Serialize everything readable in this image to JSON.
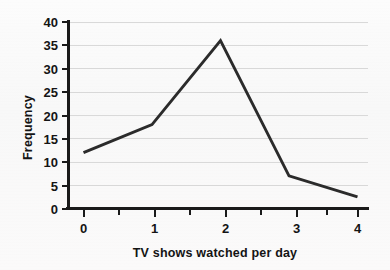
{
  "chart_data": {
    "type": "line",
    "title": "",
    "xlabel": "TV shows watched per day",
    "ylabel": "Frequency",
    "x": [
      0,
      1,
      2,
      3,
      4
    ],
    "values": [
      12,
      18,
      36,
      7,
      2.5
    ],
    "series": [
      {
        "name": "Frequency",
        "values": [
          12,
          18,
          36,
          7,
          2.5
        ]
      }
    ],
    "categories": [
      "0",
      "1",
      "2",
      "3",
      "4"
    ],
    "xlim": [
      0,
      4
    ],
    "ylim": [
      0,
      40
    ],
    "x_tick_labels": [
      "0",
      "1",
      "2",
      "3",
      "4"
    ],
    "x_tick_values": [
      0,
      1,
      2,
      3,
      4
    ],
    "x_minor_tick_values": [
      0.5,
      1.5,
      2.5,
      3.5
    ],
    "y_tick_labels": [
      "0",
      "5",
      "10",
      "15",
      "20",
      "25",
      "30",
      "35",
      "40"
    ],
    "y_tick_values": [
      0,
      5,
      10,
      15,
      20,
      25,
      30,
      35,
      40
    ],
    "grid": "horizontal",
    "legend": "none",
    "line_color": "#2b2b2b",
    "grid_color": "#d9d9d9",
    "axis_color": "#1a1a1a",
    "background_color": "#fbfbfb"
  }
}
